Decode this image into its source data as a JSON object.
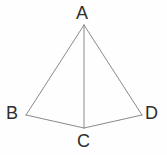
{
  "figure": {
    "type": "geometric-diagram",
    "shape_name": "tetrahedron",
    "background_color": "#fefefe",
    "line_color": "#8a8a8a",
    "label_color": "#2e2e2e",
    "line_width": 1,
    "width": 167,
    "height": 155,
    "vertices": [
      {
        "id": "A",
        "label": "A",
        "x": 84,
        "y": 25
      },
      {
        "id": "B",
        "label": "B",
        "x": 26,
        "y": 115
      },
      {
        "id": "C",
        "label": "C",
        "x": 84,
        "y": 128
      },
      {
        "id": "D",
        "label": "D",
        "x": 142,
        "y": 115
      }
    ],
    "edges": [
      {
        "id": "AB",
        "from": "A",
        "to": "B"
      },
      {
        "id": "AD",
        "from": "A",
        "to": "D"
      },
      {
        "id": "AC",
        "from": "A",
        "to": "C"
      },
      {
        "id": "BC",
        "from": "B",
        "to": "C"
      },
      {
        "id": "CD",
        "from": "C",
        "to": "D"
      }
    ]
  }
}
